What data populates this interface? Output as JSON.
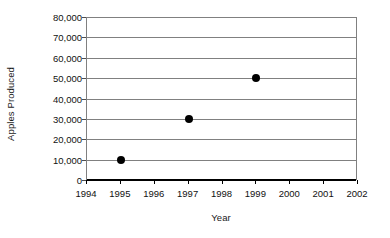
{
  "chart_data": {
    "type": "scatter",
    "title": "",
    "xlabel": "Year",
    "ylabel": "Apples Produced",
    "x": [
      1995,
      1997,
      1999
    ],
    "values": [
      10000,
      30000,
      50000
    ],
    "series": [
      {
        "name": "Apples Produced",
        "points": [
          {
            "x": 1995,
            "y": 10000
          },
          {
            "x": 1997,
            "y": 30000
          },
          {
            "x": 1999,
            "y": 50000
          }
        ]
      }
    ],
    "xlim": [
      1994,
      2002
    ],
    "ylim": [
      0,
      80000
    ],
    "x_tick_labels": [
      "1994",
      "1995",
      "1996",
      "1997",
      "1998",
      "1999",
      "2000",
      "2001",
      "2002"
    ],
    "x_tick_values": [
      1994,
      1995,
      1996,
      1997,
      1998,
      1999,
      2000,
      2001,
      2002
    ],
    "y_tick_labels": [
      "80,000",
      "70,000",
      "60,000",
      "50,000",
      "40,000",
      "30,000",
      "20,000",
      "10,000",
      "0"
    ],
    "y_tick_values": [
      80000,
      70000,
      60000,
      50000,
      40000,
      30000,
      20000,
      10000,
      0
    ],
    "grid": true,
    "legend": false,
    "legend_position": "none",
    "marker_color": "#000000",
    "gridline_color": "#808080",
    "axis_color": "#000000",
    "background_color": "#ffffff"
  }
}
